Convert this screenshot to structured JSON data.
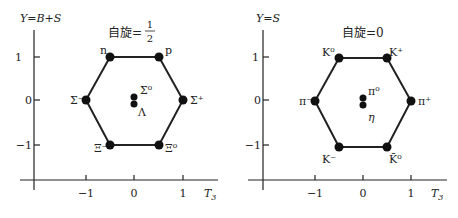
{
  "diagrams": [
    {
      "id": "baryon-octet",
      "y_axis_label": "Y=B+S",
      "x_axis_label": "T",
      "x_axis_subscript": "3",
      "title_prefix": "自旋=",
      "title_frac_num": "1",
      "title_frac_den": "2",
      "x_ticks": [
        "−1",
        "0",
        "1"
      ],
      "y_ticks": [
        "1",
        "0",
        "−1"
      ],
      "particles": [
        {
          "name": "n",
          "T3": -0.5,
          "Y": 1
        },
        {
          "name": "p",
          "T3": 0.5,
          "Y": 1
        },
        {
          "name": "Σ⁻",
          "T3": -1,
          "Y": 0
        },
        {
          "name": "Σ⁺",
          "T3": 1,
          "Y": 0
        },
        {
          "name": "Σ⁰",
          "T3": 0,
          "Y": 0
        },
        {
          "name": "Λ",
          "T3": 0,
          "Y": 0
        },
        {
          "name": "Ξ⁻",
          "T3": -0.5,
          "Y": -1
        },
        {
          "name": "Ξ⁰",
          "T3": 0.5,
          "Y": -1
        }
      ]
    },
    {
      "id": "meson-octet",
      "y_axis_label": "Y=S",
      "x_axis_label": "T",
      "x_axis_subscript": "3",
      "title_prefix": "自旋=0",
      "x_ticks": [
        "−1",
        "0",
        "1"
      ],
      "y_ticks": [
        "1",
        "0",
        "−1"
      ],
      "particles": [
        {
          "name": "K⁰",
          "T3": -0.5,
          "Y": 1
        },
        {
          "name": "K⁺",
          "T3": 0.5,
          "Y": 1
        },
        {
          "name": "π⁻",
          "T3": -1,
          "Y": 0
        },
        {
          "name": "π⁺",
          "T3": 1,
          "Y": 0
        },
        {
          "name": "π⁰",
          "T3": 0,
          "Y": 0
        },
        {
          "name": "η",
          "T3": 0,
          "Y": 0
        },
        {
          "name": "K⁻",
          "T3": -0.5,
          "Y": -1
        },
        {
          "name": "K̄⁰",
          "T3": 0.5,
          "Y": -1
        }
      ]
    }
  ]
}
